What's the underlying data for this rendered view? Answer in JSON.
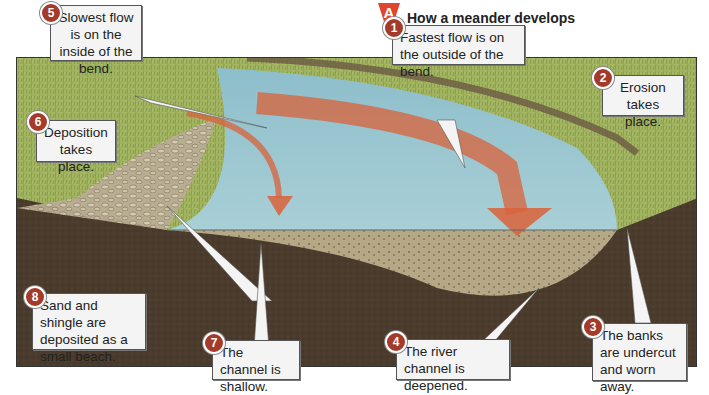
{
  "title": {
    "letter": "A",
    "text": "How a meander develops"
  },
  "colors": {
    "title_triangle": "#e0452e",
    "badge": "#a33a2a",
    "grass": "#9fb25a",
    "water": "#7fb3c2",
    "arrow": "#d9613a",
    "soil": "#4a3b2c",
    "riverbed": "#b8a98a"
  },
  "callouts": [
    {
      "number": "1",
      "text": "Fastest flow is on the outside of the bend."
    },
    {
      "number": "2",
      "text": "Erosion takes place."
    },
    {
      "number": "3",
      "text": "The banks are undercut and worn away."
    },
    {
      "number": "4",
      "text": "The river channel is deepened."
    },
    {
      "number": "5",
      "text": "Slowest flow is on the inside of the bend."
    },
    {
      "number": "6",
      "text": "Deposition takes place."
    },
    {
      "number": "7",
      "text": "The channel is shallow."
    },
    {
      "number": "8",
      "text": "Sand and shingle are deposited as a small beach."
    }
  ]
}
